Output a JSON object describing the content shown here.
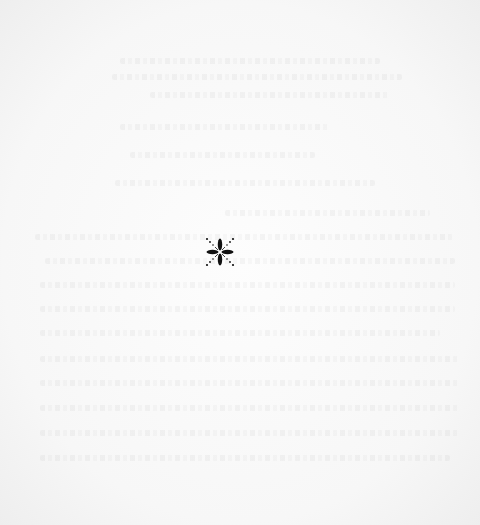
{
  "page": {
    "type": "blank-leaf",
    "background_color": "#f9f9f9",
    "bleed_through": {
      "description": "faint mirrored text showing through from reverse side, illegible",
      "color": "#e6e6e6"
    },
    "ornament": {
      "icon": "fleuron-asterism-icon",
      "glyph": "✻",
      "color": "#111111",
      "center": [
        220,
        252
      ],
      "size": 32
    }
  }
}
